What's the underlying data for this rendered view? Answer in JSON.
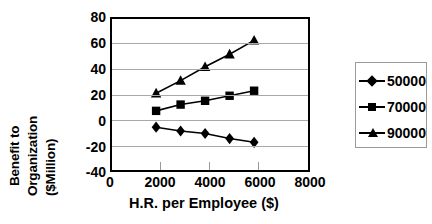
{
  "chart_data": {
    "type": "line",
    "title": "",
    "xlabel": "H.R. per Employee ($)",
    "ylabel": "Benefit to Organization ($Million)",
    "ylabel_lines": [
      "Benefit to",
      "Organization",
      "($Million)"
    ],
    "x": [
      1800,
      2800,
      3800,
      4800,
      5800
    ],
    "xlim": [
      0,
      8000
    ],
    "ylim": [
      -40,
      80
    ],
    "xticks": [
      "0",
      "2000",
      "4000",
      "6000",
      "8000"
    ],
    "xtick_values": [
      0,
      2000,
      4000,
      6000,
      8000
    ],
    "yticks": [
      "80",
      "60",
      "40",
      "20",
      "0",
      "-20",
      "-40"
    ],
    "ytick_values": [
      80,
      60,
      40,
      20,
      0,
      -20,
      -40
    ],
    "grid": true,
    "legend_position": "right",
    "series": [
      {
        "name": "50000",
        "marker": "diamond",
        "values": [
          -6,
          -9,
          -11,
          -15,
          -18
        ]
      },
      {
        "name": "70000",
        "marker": "square",
        "values": [
          7,
          12,
          15,
          19,
          23
        ]
      },
      {
        "name": "90000",
        "marker": "triangle",
        "values": [
          21,
          31,
          42,
          52,
          63
        ]
      }
    ],
    "colors": {
      "line": "#000000",
      "grid": "#a8a8a8",
      "frame": "#000000",
      "background": "#ffffff"
    }
  },
  "legend": {
    "items": [
      {
        "label": "50000",
        "marker": "diamond-marker-icon"
      },
      {
        "label": "70000",
        "marker": "square-marker-icon"
      },
      {
        "label": "90000",
        "marker": "triangle-marker-icon"
      }
    ]
  }
}
